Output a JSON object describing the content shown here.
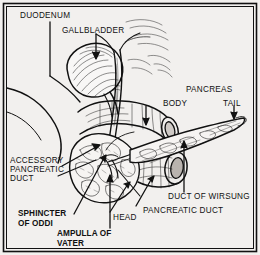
{
  "figure": {
    "kind": "anatomical-illustration",
    "style": "black-and-white engraved line drawing",
    "background_color": "#f2f0ee",
    "ink_color": "#111111",
    "frame": {
      "outer_border_color": "#111111",
      "inner_border_color": "#111111"
    }
  },
  "labels": {
    "duodenum": "DUODENUM",
    "gallbladder": "GALLBLADDER",
    "pancreas": "PANCREAS",
    "body": "BODY",
    "tail": "TAIL",
    "accessory_pancreatic_duct_1": "ACCESSORY",
    "accessory_pancreatic_duct_2": "PANCREATIC",
    "accessory_pancreatic_duct_3": "DUCT",
    "sphincter_of_oddi_1": "SPHINCTER",
    "sphincter_of_oddi_2": "OF ODDI",
    "ampulla_of_vater_1": "AMPULLA OF",
    "ampulla_of_vater_2": "VATER",
    "head": "HEAD",
    "duct_of_wirsung": "DUCT OF WIRSUNG",
    "pancreatic_duct": "PANCREATIC DUCT"
  }
}
